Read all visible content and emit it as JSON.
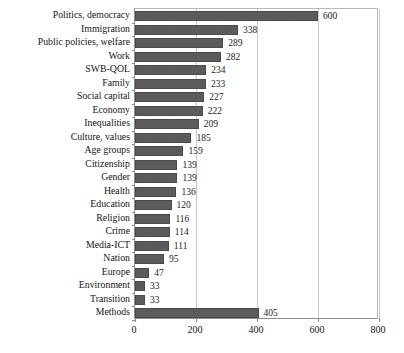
{
  "chart_data": {
    "type": "bar",
    "orientation": "horizontal",
    "title": "",
    "subtitle": "",
    "xlabel": "",
    "ylabel": "",
    "xlim": [
      0,
      800
    ],
    "xticks": [
      0,
      200,
      400,
      600,
      800
    ],
    "tick_labels": [
      "0",
      "200",
      "400",
      "600",
      "800"
    ],
    "grid": true,
    "grid_axis": "x",
    "legend": null,
    "bar_color": "#58585a",
    "show_value_labels": true,
    "categories": [
      "Politics, democracy",
      "Immigration",
      "Public policies, welfare",
      "Work",
      "SWB-QOL",
      "Family",
      "Social capital",
      "Economy",
      "Inequalities",
      "Culture, values",
      "Age groups",
      "Citizenship",
      "Gender",
      "Health",
      "Education",
      "Religion",
      "Crime",
      "Media-ICT",
      "Nation",
      "Europe",
      "Environment",
      "Transition",
      "Methods"
    ],
    "values": [
      600,
      338,
      289,
      282,
      234,
      233,
      227,
      222,
      209,
      185,
      159,
      139,
      139,
      136,
      120,
      116,
      114,
      111,
      95,
      47,
      33,
      33,
      405
    ],
    "value_labels": [
      "600",
      "338",
      "289",
      "282",
      "234",
      "233",
      "227",
      "222",
      "209",
      "185",
      "159",
      "139",
      "139",
      "136",
      "120",
      "116",
      "114",
      "111",
      "95",
      "47",
      "33",
      "33",
      "405"
    ]
  }
}
